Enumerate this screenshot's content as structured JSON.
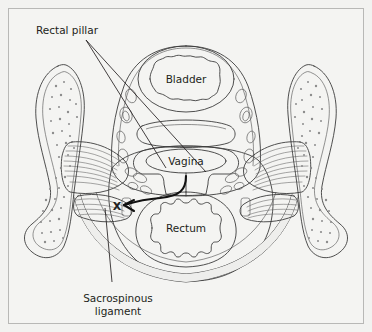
{
  "figure": {
    "background_color": "#f2f2f0",
    "border_color": "#b8b8b6",
    "ink_color": "#3c3c3c",
    "label_color": "#231f20"
  },
  "callouts": [
    {
      "id": "rectal-pillar",
      "label": "Rectal pillar",
      "lines": [
        "Rectal pillar"
      ],
      "x": 36,
      "y": 34,
      "anchor": "start"
    },
    {
      "id": "sacrospinous-ligament",
      "label": "Sacrospinous ligament",
      "lines": [
        "Sacrospinous",
        "ligament"
      ],
      "x": 118,
      "y": 302,
      "anchor": "middle"
    }
  ],
  "organ_labels": [
    {
      "id": "bladder",
      "label": "Bladder",
      "x": 186,
      "y": 76
    },
    {
      "id": "vagina",
      "label": "Vagina",
      "x": 186,
      "y": 162
    },
    {
      "id": "rectum",
      "label": "Rectum",
      "x": 186,
      "y": 228
    }
  ],
  "marker": {
    "id": "ligament-cross-marker",
    "label": "X",
    "x": 117,
    "y": 206
  },
  "palette": {
    "bone_fill": "#fbfbfa",
    "bone_inner": "#f7f6f3",
    "tissue_light": "#ececeb",
    "tissue_mid": "#dcdcda",
    "tissue_dark": "#c9c9c6",
    "muscle": "#d2d2cf",
    "organ_fill": "#d6d6d3",
    "organ_lumen": "#e6e6e3"
  }
}
